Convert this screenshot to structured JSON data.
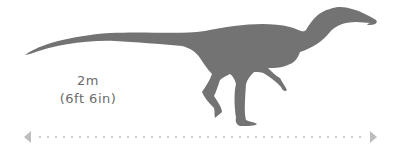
{
  "figure": {
    "silhouette_color": "#737373",
    "text_color": "#6b6b6b",
    "scale_color": "#bdbdbd"
  },
  "size_label": {
    "metric": "2m",
    "imperial": "(6ft 6in)"
  },
  "scale_bar": {
    "left_icon": "arrow-left-icon",
    "right_icon": "arrow-right-icon",
    "style": "dotted"
  }
}
